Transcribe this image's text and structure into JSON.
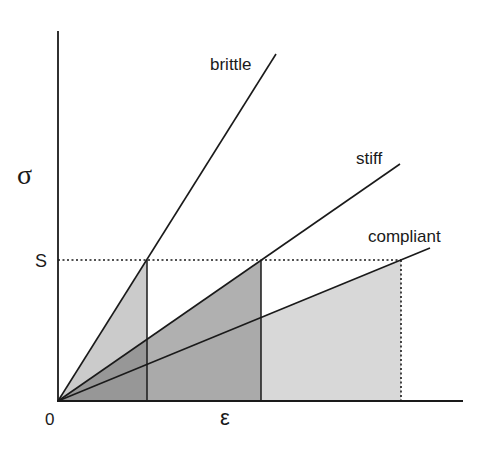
{
  "diagram": {
    "type": "stress-strain schematic",
    "axes": {
      "y_label": "σ",
      "x_label": "ε",
      "origin_label": "0",
      "stress_level_label": "S"
    },
    "curves": [
      {
        "name": "brittle",
        "label": "brittle",
        "slope_rank": 1,
        "fill": "#b4b4b4"
      },
      {
        "name": "stiff",
        "label": "stiff",
        "slope_rank": 2,
        "fill": "#9a9a9a"
      },
      {
        "name": "compliant",
        "label": "compliant",
        "slope_rank": 3,
        "fill": "#d6d6d6"
      }
    ],
    "colors": {
      "line": "#1a1a1a",
      "background": "#ffffff"
    }
  }
}
